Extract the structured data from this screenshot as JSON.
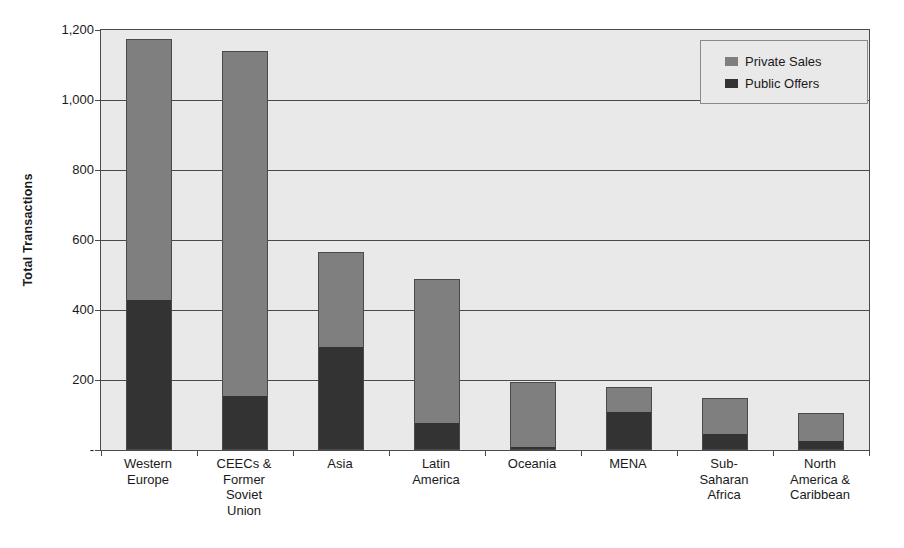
{
  "chart_data": {
    "type": "bar",
    "subtype": "stacked-vertical",
    "title": "",
    "xlabel": "",
    "ylabel": "Total Transactions",
    "ylim": [
      0,
      1200
    ],
    "yticks": [
      0,
      200,
      400,
      600,
      800,
      1000,
      1200
    ],
    "ytick_labels": [
      "-",
      "200",
      "400",
      "600",
      "800",
      "1,000",
      "1,200"
    ],
    "grid": true,
    "legend_position": "top-right",
    "categories": [
      "Western\nEurope",
      "CEECs &\nFormer\nSoviet\nUnion",
      "Asia",
      "Latin\nAmerica",
      "Oceania",
      "MENA",
      "Sub-\nSaharan\nAfrica",
      "North\nAmerica &\nCaribbean"
    ],
    "series": [
      {
        "name": "Public Offers",
        "color": "#333333",
        "values": [
          430,
          155,
          295,
          78,
          10,
          110,
          45,
          25
        ]
      },
      {
        "name": "Private Sales",
        "color": "#7f7f7f",
        "values": [
          745,
          985,
          270,
          412,
          185,
          70,
          105,
          80
        ]
      }
    ],
    "totals": [
      1175,
      1140,
      565,
      490,
      195,
      180,
      150,
      105
    ]
  },
  "legend": {
    "items": [
      {
        "label": "Private Sales",
        "swatch": "light"
      },
      {
        "label": "Public Offers",
        "swatch": "dark"
      }
    ]
  },
  "colors": {
    "plot_background": "#e9e9e9",
    "axis": "#4a4a4a",
    "series_dark": "#333333",
    "series_light": "#7f7f7f",
    "page_background": "#ffffff"
  }
}
